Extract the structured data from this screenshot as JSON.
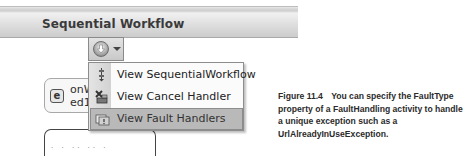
{
  "header": {
    "title": "Sequential Workflow"
  },
  "view_dropdown": {
    "icon": "down-arrow-circle-icon",
    "caret": "chevron-down-icon"
  },
  "designer": {
    "activity": {
      "icon": "event-activity-icon",
      "label_line1": "onWe",
      "label_line2": "ed1"
    },
    "lower_box_text": "· · ·· ·· ·"
  },
  "menu": {
    "items": [
      {
        "label": "View SequentialWorkflow",
        "icon": "sequential-workflow-icon",
        "selected": false
      },
      {
        "label": "View Cancel Handler",
        "icon": "cancel-handler-icon",
        "selected": false
      },
      {
        "label": "View Fault Handlers",
        "icon": "fault-handlers-icon",
        "selected": true
      }
    ]
  },
  "caption": {
    "figure": "Figure 11.4",
    "text": "You can specify the FaultType property of a FaultHandling activity to handle a unique exception such as a UrlAlreadyInUseException."
  }
}
